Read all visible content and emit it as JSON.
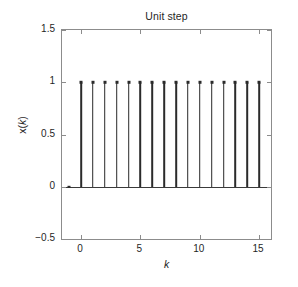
{
  "chart_data": {
    "type": "bar",
    "plot_style": "stem",
    "title": "Unit step",
    "xlabel": "k",
    "ylabel": "x(k)",
    "xlim": [
      -1.6,
      16.0
    ],
    "ylim": [
      -0.5,
      1.5
    ],
    "xticks": [
      0,
      5,
      10,
      15
    ],
    "xtick_labels": [
      "0",
      "5",
      "10",
      "15"
    ],
    "yticks": [
      -0.5,
      0,
      0.5,
      1,
      1.5
    ],
    "ytick_labels": [
      "-0.5",
      "0",
      "0.5",
      "1",
      "1.5"
    ],
    "grid": false,
    "legend": null,
    "series": [
      {
        "name": "u(k)",
        "x": [
          -1,
          0,
          1,
          2,
          3,
          4,
          5,
          6,
          7,
          8,
          9,
          10,
          11,
          12,
          13,
          14,
          15
        ],
        "values": [
          0,
          1,
          1,
          1,
          1,
          1,
          1,
          1,
          1,
          1,
          1,
          1,
          1,
          1,
          1,
          1,
          1
        ]
      }
    ],
    "baseline": 0,
    "colors": {
      "stem": "#2b2b2b",
      "axis": "#8c8c8c",
      "text": "#1f1f1f",
      "background": "#ffffff"
    }
  },
  "figure": {
    "title": "Unit step",
    "x_axis_label": "k",
    "y_axis_label_prefix": "x(",
    "y_axis_label_var": "k",
    "y_axis_label_suffix": ")"
  }
}
